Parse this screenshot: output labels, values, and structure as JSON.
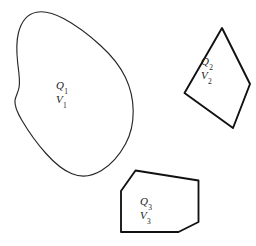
{
  "figure": {
    "background_color": "#ffffff",
    "stroke_color": "#1a1a1a",
    "width": 256,
    "height": 246
  },
  "shapes": [
    {
      "id": "blob",
      "name": "irregular-closed-blob",
      "kind": "freeform-closed-curve",
      "charge_symbol": "Q",
      "charge_subscript": "1",
      "volume_symbol": "V",
      "volume_subscript": "1",
      "label_text": "Q1 V1"
    },
    {
      "id": "tetrahedron",
      "name": "tetrahedron",
      "kind": "polyhedron",
      "charge_symbol": "Q",
      "charge_subscript": "2",
      "volume_symbol": "V",
      "volume_subscript": "2",
      "label_text": "Q2 V2"
    },
    {
      "id": "cube",
      "name": "cube",
      "kind": "polyhedron",
      "charge_symbol": "Q",
      "charge_subscript": "3",
      "volume_symbol": "V",
      "volume_subscript": "3",
      "label_text": "Q3 V3"
    }
  ]
}
